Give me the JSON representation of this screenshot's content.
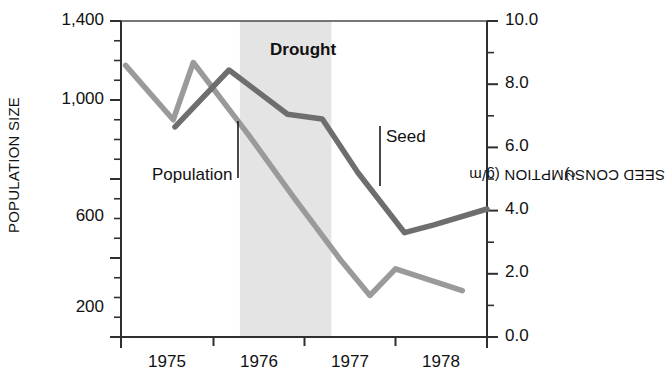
{
  "chart_data": {
    "type": "line",
    "title": "",
    "xlabel": "",
    "ylabel": "POPULATION SIZE",
    "ylabel_right": "SEED CONSUMPTION (g/m",
    "ylabel_right_sup": "2",
    "ylabel_right_tail": ")",
    "grid": false,
    "legend_position": "inline-annotations",
    "xlim": [
      1974.7,
      1978.7
    ],
    "ylim_left": [
      0,
      1600
    ],
    "ylim_right": [
      0.0,
      10.0
    ],
    "x_ticks": [
      1975,
      1976,
      1977,
      1978
    ],
    "x_tick_labels": [
      "1975",
      "1976",
      "1977",
      "1978"
    ],
    "y_ticks_left": [
      200,
      600,
      1000,
      1400
    ],
    "y_tick_labels_left": [
      "200",
      "600",
      "1,000",
      "1,400"
    ],
    "y_minor_ticks_left": [
      300,
      400,
      500,
      700,
      800,
      900,
      1100,
      1200,
      1300
    ],
    "y_ticks_right": [
      0.0,
      2.0,
      4.0,
      6.0,
      8.0,
      10.0
    ],
    "y_tick_labels_right": [
      "0.0",
      "2.0",
      "4.0",
      "6.0",
      "8.0",
      "10.0"
    ],
    "y_minor_ticks_right": [
      1.0,
      3.0,
      5.0,
      7.0,
      9.0
    ],
    "shaded_region": {
      "label": "Drought",
      "x_start": 1976.0,
      "x_end": 1977.0,
      "color": "#e4e4e4"
    },
    "series": [
      {
        "name": "Population",
        "axis": "left",
        "color": "#9a9a9a",
        "linewidth": 5,
        "x": [
          1974.75,
          1975.27,
          1975.49,
          1976.1,
          1976.6,
          1977.1,
          1977.42,
          1977.7,
          1978.43
        ],
        "values": [
          1375,
          1100,
          1390,
          1020,
          700,
          390,
          210,
          345,
          235
        ]
      },
      {
        "name": "Seed",
        "axis": "right",
        "color": "#6e6e6e",
        "linewidth": 5,
        "x": [
          1975.29,
          1975.88,
          1976.52,
          1976.9,
          1977.29,
          1977.8,
          1978.12,
          1978.7
        ],
        "values": [
          6.65,
          8.45,
          7.05,
          6.9,
          5.2,
          3.3,
          3.55,
          4.05
        ]
      }
    ],
    "annotations": [
      {
        "text": "Drought",
        "x": 1976.5,
        "y_frac": 0.88,
        "bold": true
      },
      {
        "text": "Population",
        "x": 1975.55,
        "y_frac": 0.53,
        "bold": false,
        "leader": {
          "from_x": 1975.76,
          "from_y_frac": 0.72,
          "to_y_frac": 0.52
        }
      },
      {
        "text": "Seed",
        "x": 1977.45,
        "y_frac": 0.58,
        "bold": false,
        "leader": {
          "from_x": 1977.4,
          "from_y_frac": 0.62,
          "to_y_frac": 0.41
        }
      }
    ]
  },
  "layout": {
    "plot_left": 121,
    "plot_right": 487,
    "plot_top": 21,
    "plot_bottom": 337
  },
  "colors": {
    "population_line": "#9a9a9a",
    "seed_line": "#6e6e6e",
    "drought_band": "#e4e4e4",
    "axis": "#3a3a3a",
    "text": "#111111",
    "background": "#ffffff"
  }
}
